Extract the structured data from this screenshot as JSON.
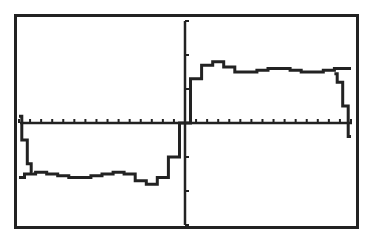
{
  "screen": {
    "device": "graphing calculator graph screen",
    "frame_color": "#222222",
    "background": "#ffffff"
  },
  "chart_data": {
    "type": "line",
    "title": "",
    "xlabel": "",
    "ylabel": "",
    "grid": false,
    "legend": null,
    "axes": {
      "x_ticks_visible": true,
      "y_ticks_visible": true,
      "tick_labels_visible": false,
      "x_tick_count_left": 15,
      "x_tick_count_right": 15,
      "y_tick_count_above": 3,
      "y_tick_count_below": 3
    },
    "xlim": [
      -15,
      15
    ],
    "ylim": [
      -3,
      3
    ],
    "series": [
      {
        "name": "curve",
        "x": [
          -15,
          -14,
          -13,
          -12,
          -11,
          -10,
          -9,
          -8,
          -7,
          -6,
          -5,
          -4,
          -3,
          -2,
          -1,
          0,
          1,
          2,
          3,
          4,
          5,
          6,
          7,
          8,
          9,
          10,
          11,
          12,
          13,
          14,
          15
        ],
        "y": [
          -1.6,
          -1.5,
          -1.45,
          -1.5,
          -1.55,
          -1.6,
          -1.6,
          -1.55,
          -1.5,
          -1.45,
          -1.5,
          -1.7,
          -1.8,
          -1.6,
          -1.0,
          0.0,
          1.3,
          1.7,
          1.8,
          1.65,
          1.5,
          1.5,
          1.55,
          1.6,
          1.6,
          1.55,
          1.5,
          1.5,
          1.55,
          1.6,
          1.6
        ]
      },
      {
        "name": "edge-wrap-left",
        "x": [
          -15,
          -14.5,
          -14,
          -13.8
        ],
        "y": [
          0.2,
          -0.5,
          -1.2,
          -1.45
        ]
      },
      {
        "name": "edge-wrap-right",
        "x": [
          13.5,
          14,
          14.5,
          15
        ],
        "y": [
          1.45,
          1.2,
          0.5,
          -0.4
        ]
      }
    ]
  }
}
